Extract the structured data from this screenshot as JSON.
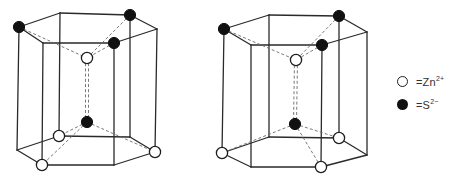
{
  "figure": {
    "colors": {
      "line": "#2a2a2a",
      "dashed": "#6a6a6a",
      "filled_atom": "#111111",
      "open_atom": "#ffffff"
    },
    "prisms": [
      {
        "name": "prism-left",
        "top": [
          [
            19,
            27
          ],
          [
            60,
            13
          ],
          [
            130,
            15
          ],
          [
            157,
            29
          ],
          [
            114,
            43
          ],
          [
            43,
            43
          ]
        ],
        "bottom": [
          [
            17,
            150
          ],
          [
            59,
            136
          ],
          [
            130,
            137
          ],
          [
            155,
            152
          ],
          [
            114,
            165
          ],
          [
            42,
            165
          ]
        ],
        "hidden_edges": {
          "top": [
            [
              0,
              1
            ],
            [
              1,
              2
            ],
            [
              2,
              3
            ],
            [
              3,
              4
            ],
            [
              4,
              5
            ],
            [
              5,
              0
            ]
          ],
          "bottom": []
        },
        "center_top": [
          87,
          58
        ],
        "center_bottom": [
          87,
          122
        ],
        "atoms": [
          {
            "pos": [
              19,
              27
            ],
            "type": "S"
          },
          {
            "pos": [
              130,
              15
            ],
            "type": "S"
          },
          {
            "pos": [
              114,
              43
            ],
            "type": "S"
          },
          {
            "pos": [
              87,
              58
            ],
            "type": "Zn"
          },
          {
            "pos": [
              87,
              122
            ],
            "type": "S"
          },
          {
            "pos": [
              59,
              136
            ],
            "type": "Zn"
          },
          {
            "pos": [
              155,
              152
            ],
            "type": "Zn"
          },
          {
            "pos": [
              42,
              165
            ],
            "type": "Zn"
          }
        ],
        "dashed": [
          [
            [
              19,
              27
            ],
            [
              87,
              58
            ]
          ],
          [
            [
              130,
              15
            ],
            [
              87,
              58
            ]
          ],
          [
            [
              114,
              43
            ],
            [
              87,
              58
            ]
          ],
          [
            [
              87,
              58
            ],
            [
              87,
              122
            ]
          ],
          [
            [
              87,
              122
            ],
            [
              59,
              136
            ]
          ],
          [
            [
              87,
              122
            ],
            [
              155,
              152
            ]
          ],
          [
            [
              87,
              122
            ],
            [
              42,
              165
            ]
          ]
        ]
      },
      {
        "name": "prism-right",
        "top": [
          [
            224,
            29
          ],
          [
            269,
            15
          ],
          [
            339,
            16
          ],
          [
            367,
            32
          ],
          [
            322,
            45
          ],
          [
            251,
            45
          ]
        ],
        "bottom": [
          [
            222,
            153
          ],
          [
            269,
            137
          ],
          [
            339,
            138
          ],
          [
            367,
            155
          ],
          [
            321,
            167
          ],
          [
            251,
            167
          ]
        ],
        "center_top": [
          296,
          60
        ],
        "center_bottom": [
          295,
          124
        ],
        "atoms": [
          {
            "pos": [
              224,
              29
            ],
            "type": "S"
          },
          {
            "pos": [
              339,
              16
            ],
            "type": "S"
          },
          {
            "pos": [
              322,
              45
            ],
            "type": "S"
          },
          {
            "pos": [
              296,
              60
            ],
            "type": "Zn"
          },
          {
            "pos": [
              295,
              124
            ],
            "type": "S"
          },
          {
            "pos": [
              222,
              153
            ],
            "type": "Zn"
          },
          {
            "pos": [
              339,
              138
            ],
            "type": "Zn"
          },
          {
            "pos": [
              321,
              167
            ],
            "type": "Zn"
          }
        ],
        "dashed": [
          [
            [
              224,
              29
            ],
            [
              296,
              60
            ]
          ],
          [
            [
              339,
              16
            ],
            [
              296,
              60
            ]
          ],
          [
            [
              322,
              45
            ],
            [
              296,
              60
            ]
          ],
          [
            [
              296,
              60
            ],
            [
              295,
              124
            ]
          ],
          [
            [
              295,
              124
            ],
            [
              222,
              153
            ]
          ],
          [
            [
              295,
              124
            ],
            [
              339,
              138
            ]
          ],
          [
            [
              295,
              124
            ],
            [
              321,
              167
            ]
          ]
        ]
      }
    ]
  },
  "legend": {
    "items": [
      {
        "symbol": "open-circle",
        "prefix": "=Zn",
        "charge": "2+"
      },
      {
        "symbol": "filled-circle",
        "prefix": "=S",
        "charge": "2−"
      }
    ]
  }
}
